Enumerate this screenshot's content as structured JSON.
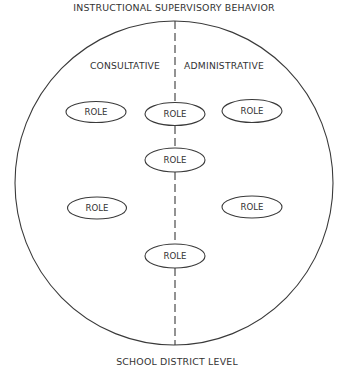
{
  "diagram": {
    "title": "INSTRUCTIONAL SUPERVISORY BEHAVIOR",
    "bottom_label": "SCHOOL DISTRICT LEVEL",
    "left_section_label": "CONSULTATIVE",
    "right_section_label": "ADMINISTRATIVE",
    "stroke_color": "#3a3a3a",
    "background_color": "#ffffff",
    "roles": [
      {
        "label": "ROLE",
        "position": "upper-left"
      },
      {
        "label": "ROLE",
        "position": "upper-center"
      },
      {
        "label": "ROLE",
        "position": "upper-right"
      },
      {
        "label": "ROLE",
        "position": "middle-center"
      },
      {
        "label": "ROLE",
        "position": "lower-left"
      },
      {
        "label": "ROLE",
        "position": "lower-right"
      },
      {
        "label": "ROLE",
        "position": "bottom-center"
      }
    ]
  }
}
